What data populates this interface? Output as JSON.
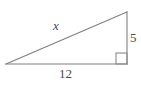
{
  "figure": {
    "kind": "right-triangle-diagram",
    "background_color": "#ffffff",
    "stroke_color": "#808080",
    "label_color": "#4a4a4a",
    "stroke_width": 1,
    "vertices": {
      "left": {
        "x": 6,
        "y": 64
      },
      "bottom_right": {
        "x": 127,
        "y": 64
      },
      "top_right": {
        "x": 127,
        "y": 12
      }
    },
    "right_angle_marker": {
      "name": "right-angle-square",
      "x": 116,
      "y": 53,
      "size": 11,
      "at_vertex": "bottom_right"
    },
    "labels": {
      "hypotenuse": "x",
      "base": "12",
      "vertical": "5"
    },
    "sides": [
      {
        "name": "hypotenuse",
        "label": "x",
        "from": "left",
        "to": "top_right",
        "label_style": "italic"
      },
      {
        "name": "base",
        "label": "12",
        "from": "left",
        "to": "bottom_right",
        "label_style": "normal"
      },
      {
        "name": "vertical-leg",
        "label": "5",
        "from": "bottom_right",
        "to": "top_right",
        "label_style": "normal"
      }
    ]
  }
}
